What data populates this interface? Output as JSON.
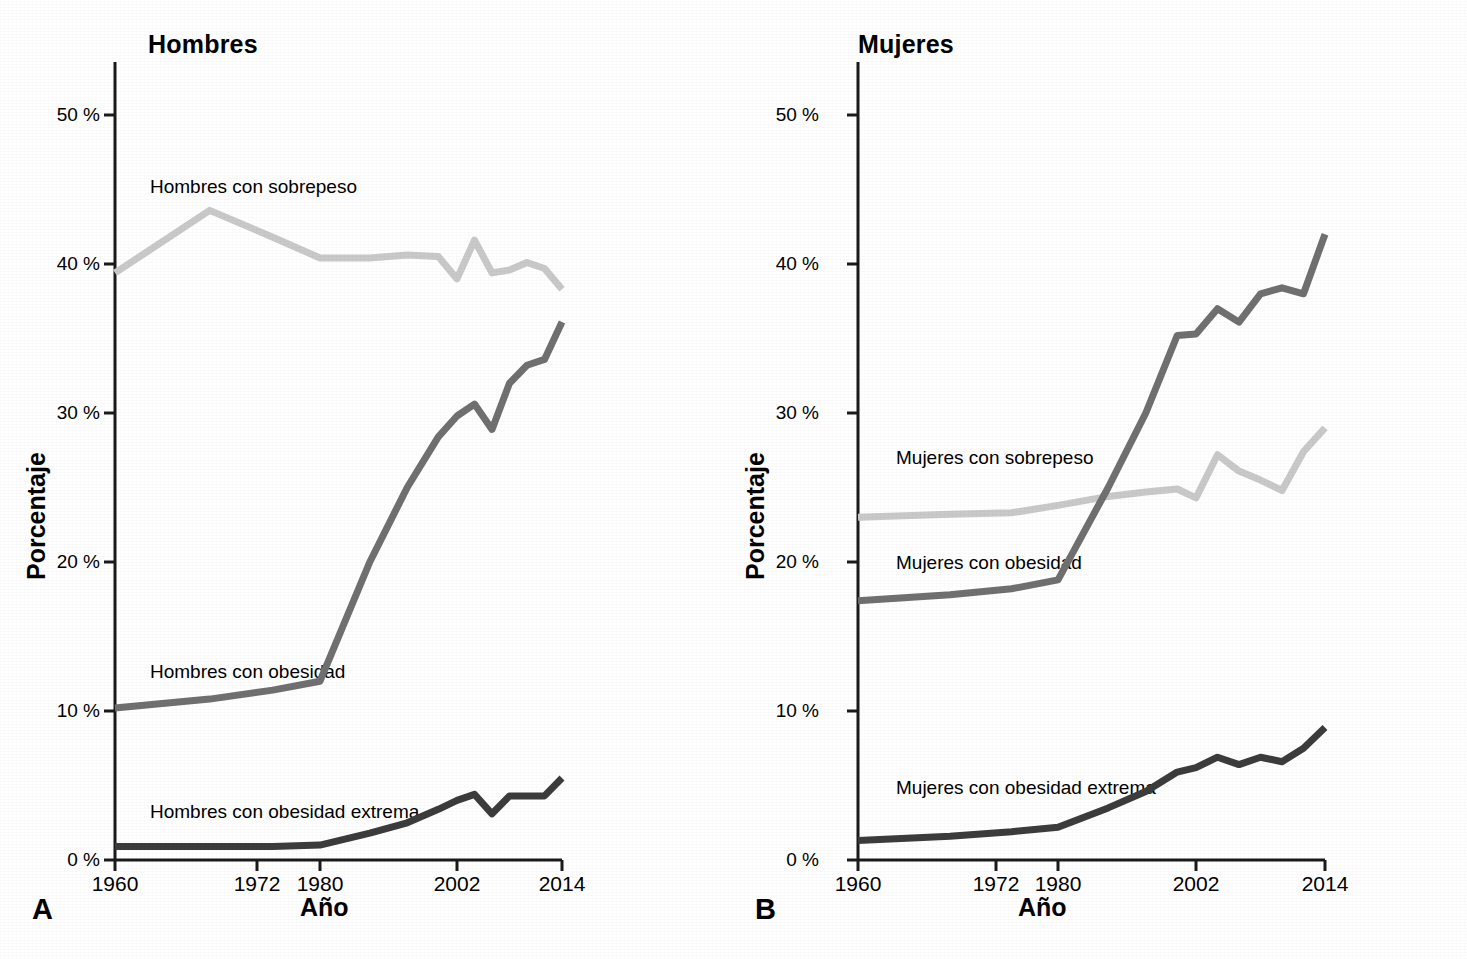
{
  "figure": {
    "background": "#ffffff",
    "series_colors": {
      "sobrepeso": "#c9c9c9",
      "obesidad": "#707070",
      "obesidad_extrema": "#3c3c3c"
    },
    "axis_color": "#1a1a1a"
  },
  "panels": [
    {
      "letter": "A",
      "title": "Hombres",
      "xlabel": "Año",
      "ylabel": "Porcentaje",
      "labels": {
        "sobrepeso": "Hombres con sobrepeso",
        "obesidad": "Hombres con obesidad",
        "obesidad_extrema": "Hombres con obesidad extrema"
      }
    },
    {
      "letter": "B",
      "title": "Mujeres",
      "xlabel": "Año",
      "ylabel": "Porcentaje",
      "labels": {
        "sobrepeso": "Mujeres con sobrepeso",
        "obesidad": "Mujeres con obesidad",
        "obesidad_extrema": "Mujeres con obesidad extrema"
      }
    }
  ],
  "ticks": {
    "y": [
      "0 %",
      "10 %",
      "20 %",
      "30 %",
      "40 %",
      "50 %"
    ],
    "x": [
      "1960",
      "1972",
      "1980",
      "2002",
      "2014"
    ]
  },
  "chart_data": [
    {
      "type": "line",
      "panel": "A",
      "title": "Hombres",
      "xlabel": "Año",
      "ylabel": "Porcentaje",
      "xlim": [
        1960,
        2014
      ],
      "ylim": [
        0,
        53
      ],
      "xticks": [
        1960,
        1972,
        1980,
        2002,
        2014
      ],
      "yticks": [
        0,
        10,
        20,
        30,
        40,
        50
      ],
      "grid": false,
      "legend": "inline-labels",
      "series": [
        {
          "name": "Hombres con sobrepeso",
          "color": "#c9c9c9",
          "x": [
            1960,
            1968,
            1974,
            1980,
            1988,
            1994,
            1999,
            2002,
            2004,
            2006,
            2008,
            2010,
            2012,
            2014
          ],
          "values": [
            39.4,
            43.6,
            41.8,
            40.4,
            40.4,
            40.6,
            40.5,
            39.0,
            41.6,
            39.4,
            39.6,
            40.1,
            39.7,
            38.3
          ]
        },
        {
          "name": "Hombres con obesidad",
          "color": "#707070",
          "x": [
            1960,
            1968,
            1974,
            1980,
            1988,
            1994,
            1999,
            2002,
            2004,
            2006,
            2008,
            2010,
            2012,
            2014
          ],
          "values": [
            10.2,
            10.8,
            11.4,
            12.0,
            20.0,
            25.0,
            28.4,
            29.8,
            30.6,
            28.9,
            32.0,
            33.2,
            33.6,
            36.1
          ]
        },
        {
          "name": "Hombres con obesidad extrema",
          "color": "#3c3c3c",
          "x": [
            1960,
            1968,
            1974,
            1980,
            1988,
            1994,
            1999,
            2002,
            2004,
            2006,
            2008,
            2010,
            2012,
            2014
          ],
          "values": [
            0.9,
            0.9,
            0.9,
            1.0,
            1.8,
            2.5,
            3.4,
            4.0,
            4.4,
            3.1,
            4.3,
            4.3,
            4.3,
            5.5
          ]
        }
      ]
    },
    {
      "type": "line",
      "panel": "B",
      "title": "Mujeres",
      "xlabel": "Año",
      "ylabel": "Porcentaje",
      "xlim": [
        1960,
        2014
      ],
      "ylim": [
        0,
        53
      ],
      "xticks": [
        1960,
        1972,
        1980,
        2002,
        2014
      ],
      "yticks": [
        0,
        10,
        20,
        30,
        40,
        50
      ],
      "grid": false,
      "legend": "inline-labels",
      "series": [
        {
          "name": "Mujeres con sobrepeso",
          "color": "#c9c9c9",
          "x": [
            1960,
            1968,
            1974,
            1980,
            1988,
            1994,
            1999,
            2002,
            2004,
            2006,
            2008,
            2010,
            2012,
            2014
          ],
          "values": [
            23.0,
            23.2,
            23.3,
            23.8,
            24.4,
            24.7,
            24.9,
            24.3,
            27.2,
            26.1,
            25.5,
            24.8,
            27.4,
            29.0
          ]
        },
        {
          "name": "Mujeres con obesidad",
          "color": "#707070",
          "x": [
            1960,
            1968,
            1974,
            1980,
            1988,
            1994,
            1999,
            2002,
            2004,
            2006,
            2008,
            2010,
            2012,
            2014
          ],
          "values": [
            17.4,
            17.8,
            18.2,
            18.8,
            25.0,
            30.0,
            35.2,
            35.3,
            37.0,
            36.1,
            38.0,
            38.4,
            38.0,
            42.0
          ]
        },
        {
          "name": "Mujeres con obesidad extrema",
          "color": "#3c3c3c",
          "x": [
            1960,
            1968,
            1974,
            1980,
            1988,
            1994,
            1999,
            2002,
            2004,
            2006,
            2008,
            2010,
            2012,
            2014
          ],
          "values": [
            1.3,
            1.6,
            1.9,
            2.2,
            3.5,
            4.6,
            5.9,
            6.2,
            6.9,
            6.4,
            6.9,
            6.6,
            7.5,
            8.9
          ]
        }
      ]
    }
  ]
}
